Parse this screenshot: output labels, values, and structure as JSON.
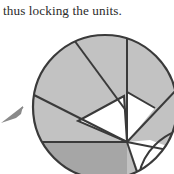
{
  "page": {
    "width": 174,
    "height": 174,
    "background_color": "#ffffff"
  },
  "caption": {
    "text": "thus locking the units.",
    "color": "#2b2b2b"
  },
  "figure": {
    "name": "iris-diaphragm-diagram",
    "colors": {
      "blade_light": "#c2c2c2",
      "blade_dark": "#a6a6a6",
      "aperture_white": "#ffffff",
      "outline": "#3a3a3a",
      "pointer_arrow": "#8a8a8a"
    },
    "circle": {
      "center_x": 105,
      "center_y": 107,
      "radius": 72,
      "stroke_width": 2
    },
    "pivot": {
      "x": 127,
      "y": 142
    },
    "pointer": {
      "name": "leader-arrow",
      "tip_x": 2,
      "tip_y": 122,
      "tail_x": 24,
      "tail_y": 108
    },
    "blade_count": 7
  }
}
